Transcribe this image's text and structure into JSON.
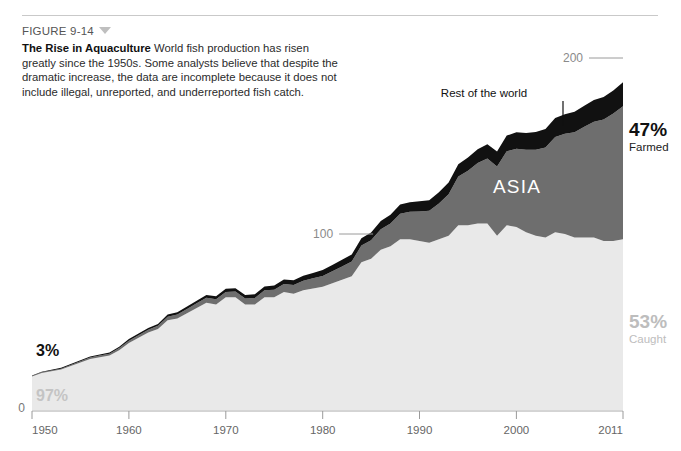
{
  "figure": {
    "number_label": "FIGURE 9-14",
    "triangle_icon": "triangle-down-icon",
    "title": "The Rise in Aquaculture",
    "body": "World fish production has risen greatly since the 1950s. Some analysts believe that despite the dramatic increase, the data are incomplete because it does not include illegal, unreported, and underreported fish catch."
  },
  "colors": {
    "caught": "#e9e9e9",
    "asia": "#6e6e6e",
    "rest_of_world": "#111111",
    "background": "#ffffff",
    "rule": "#c9c9c9",
    "axis_text": "#666666",
    "gridline_text": "#8a8a8a",
    "light_pct_text": "#bdbdbd"
  },
  "annotations": {
    "asia": "ASIA",
    "rest_of_world": "Rest of the world",
    "left_farmed_pct": "3%",
    "left_caught_pct": "97%",
    "right_farmed_pct": "47%",
    "right_farmed_word": "Farmed",
    "right_caught_pct": "53%",
    "right_caught_word": "Caught"
  },
  "chart_data": {
    "type": "area",
    "stacked": true,
    "title": "The Rise in Aquaculture",
    "xlabel": "",
    "ylabel": "",
    "xlim": [
      1950,
      2011
    ],
    "ylim": [
      0,
      210
    ],
    "grid": false,
    "legend_position": "inline-annotation",
    "y_gridlines": [
      {
        "value": 100,
        "label": "100"
      },
      {
        "value": 200,
        "label": "200"
      }
    ],
    "y_zero_label": "0",
    "x_ticks": [
      1950,
      1960,
      1970,
      1980,
      1990,
      2000,
      2011
    ],
    "x_tick_labels": [
      "1950",
      "1960",
      "1970",
      "1980",
      "1990",
      "2000",
      "2011"
    ],
    "units": "million metric tons of fish production",
    "x": [
      1950,
      1951,
      1952,
      1953,
      1954,
      1955,
      1956,
      1957,
      1958,
      1959,
      1960,
      1961,
      1962,
      1963,
      1964,
      1965,
      1966,
      1967,
      1968,
      1969,
      1970,
      1971,
      1972,
      1973,
      1974,
      1975,
      1976,
      1977,
      1978,
      1979,
      1980,
      1981,
      1982,
      1983,
      1984,
      1985,
      1986,
      1987,
      1988,
      1989,
      1990,
      1991,
      1992,
      1993,
      1994,
      1995,
      1996,
      1997,
      1998,
      1999,
      2000,
      2001,
      2002,
      2003,
      2004,
      2005,
      2006,
      2007,
      2008,
      2009,
      2010,
      2011
    ],
    "series": [
      {
        "name": "Caught",
        "color": "#e9e9e9",
        "values": [
          19,
          21,
          22,
          23,
          25,
          27,
          29,
          30,
          31,
          34,
          38,
          41,
          44,
          46,
          51,
          52,
          55,
          58,
          61,
          60,
          64,
          64,
          60,
          60,
          64,
          64,
          67,
          66,
          68,
          69,
          70,
          72,
          74,
          76,
          84,
          86,
          91,
          93,
          97,
          97,
          96,
          95,
          97,
          99,
          105,
          105,
          106,
          106,
          99,
          105,
          104,
          101,
          99,
          98,
          101,
          100,
          98,
          98,
          98,
          96,
          96,
          97
        ]
      },
      {
        "name": "ASIA",
        "color": "#6e6e6e",
        "values": [
          0.3,
          0.4,
          0.4,
          0.5,
          0.6,
          0.7,
          0.8,
          0.9,
          1.0,
          1.2,
          1.4,
          1.5,
          1.6,
          1.8,
          2.0,
          2.2,
          2.4,
          2.6,
          2.8,
          2.9,
          3.1,
          3.3,
          3.4,
          3.7,
          4.0,
          4.3,
          4.6,
          5.0,
          5.4,
          5.8,
          6.2,
          6.9,
          7.6,
          8.4,
          9.4,
          10.5,
          11.7,
          13.0,
          14.5,
          15.6,
          16.8,
          18.2,
          20.4,
          23.6,
          27.6,
          31.0,
          34.3,
          36.9,
          39.4,
          42.0,
          44.5,
          46.8,
          48.9,
          51.2,
          54.1,
          56.9,
          59.8,
          62.9,
          65.8,
          69.1,
          72.4,
          75.6
        ]
      },
      {
        "name": "Rest of the world",
        "color": "#111111",
        "values": [
          0.3,
          0.35,
          0.4,
          0.45,
          0.5,
          0.55,
          0.6,
          0.65,
          0.7,
          0.8,
          0.9,
          0.95,
          1.0,
          1.1,
          1.2,
          1.3,
          1.4,
          1.5,
          1.6,
          1.7,
          1.8,
          1.9,
          2.0,
          2.1,
          2.2,
          2.4,
          2.5,
          2.7,
          2.9,
          3.1,
          3.3,
          3.5,
          3.7,
          3.9,
          4.2,
          4.4,
          4.7,
          5.0,
          5.3,
          5.5,
          5.8,
          6.0,
          6.3,
          6.6,
          7.0,
          7.4,
          7.8,
          8.1,
          8.5,
          8.9,
          9.3,
          9.6,
          10.0,
          10.4,
          10.8,
          11.2,
          11.6,
          12.0,
          12.4,
          12.8,
          13.2,
          13.6
        ]
      }
    ]
  }
}
